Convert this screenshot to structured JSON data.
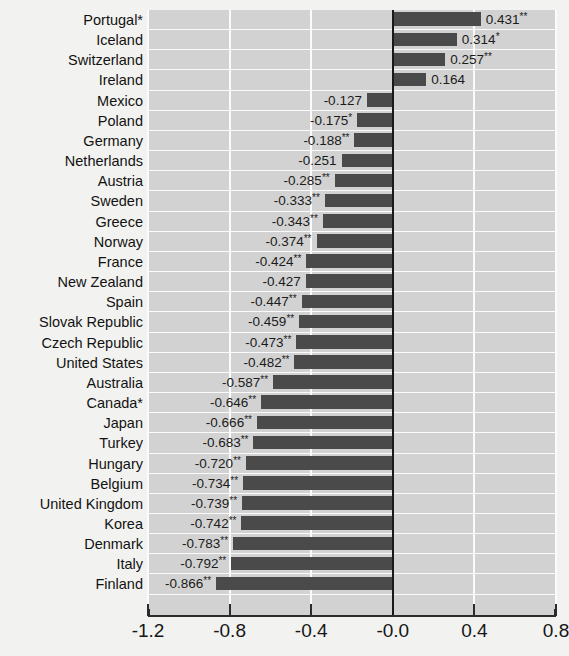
{
  "chart_data": {
    "type": "bar",
    "orientation": "horizontal",
    "title": "",
    "xlabel": "",
    "ylabel": "",
    "xlim": [
      -1.2,
      0.8
    ],
    "grid": true,
    "legend": null,
    "xticks": [
      "-1.2",
      "-0.8",
      "-0.4",
      "-0.0",
      "0.4",
      "0.8"
    ],
    "xtick_values": [
      -1.2,
      -0.8,
      -0.4,
      -0.0,
      0.4,
      0.8
    ],
    "categories": [
      "Portugal*",
      "Iceland",
      "Switzerland",
      "Ireland",
      "Mexico",
      "Poland",
      "Germany",
      "Netherlands",
      "Austria",
      "Sweden",
      "Greece",
      "Norway",
      "France",
      "New Zealand",
      "Spain",
      "Slovak Republic",
      "Czech Republic",
      "United States",
      "Australia",
      "Canada*",
      "Japan",
      "Turkey",
      "Hungary",
      "Belgium",
      "United Kingdom",
      "Korea",
      "Denmark",
      "Italy",
      "Finland"
    ],
    "values": [
      0.431,
      0.314,
      0.257,
      0.164,
      -0.127,
      -0.175,
      -0.188,
      -0.251,
      -0.285,
      -0.333,
      -0.343,
      -0.374,
      -0.424,
      -0.427,
      -0.447,
      -0.459,
      -0.473,
      -0.482,
      -0.587,
      -0.646,
      -0.666,
      -0.683,
      -0.72,
      -0.734,
      -0.739,
      -0.742,
      -0.783,
      -0.792,
      -0.866
    ],
    "value_labels": [
      "0.431",
      "0.314",
      "0.257",
      "0.164",
      "-0.127",
      "-0.175",
      "-0.188",
      "-0.251",
      "-0.285",
      "-0.333",
      "-0.343",
      "-0.374",
      "-0.424",
      "-0.427",
      "-0.447",
      "-0.459",
      "-0.473",
      "-0.482",
      "-0.587",
      "-0.646",
      "-0.666",
      "-0.683",
      "-0.720",
      "-0.734",
      "-0.739",
      "-0.742",
      "-0.783",
      "-0.792",
      "-0.866"
    ],
    "significance": [
      "**",
      "*",
      "**",
      "",
      "",
      "*",
      "**",
      "",
      "**",
      "**",
      "**",
      "**",
      "**",
      "",
      "**",
      "**",
      "**",
      "**",
      "**",
      "**",
      "**",
      "**",
      "**",
      "**",
      "**",
      "**",
      "**",
      "**",
      "**"
    ],
    "colors": {
      "bar": "#4a4a4a",
      "plot_background": "#d2d2d2",
      "gridline": "#fbfbfb",
      "zero_line": "#1a1a1a",
      "page_background": "#f2f2f0",
      "text": "#121212"
    }
  }
}
